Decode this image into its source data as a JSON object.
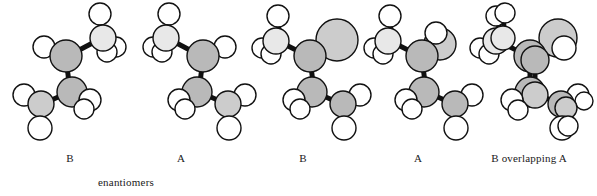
{
  "figure": {
    "type": "molecular-model-figure",
    "background": "#ffffff",
    "width": 597,
    "height": 196,
    "colors": {
      "hydrogen": "#ffffff",
      "carbon": "#b9b9b9",
      "carbon_light": "#e8e8e8",
      "substituent_large": "#cccccc",
      "outline": "#111111",
      "bond": "#111111",
      "text": "#1a1a1a"
    }
  },
  "models": [
    {
      "id": "model-1",
      "label": "B",
      "label_x": 70,
      "label_y": 152,
      "x": 8,
      "width": 132,
      "description": "ball-and-stick model B, first enantiomer"
    },
    {
      "id": "model-2",
      "label": "A",
      "label_x": 181,
      "label_y": 152,
      "x": 130,
      "width": 132,
      "description": "ball-and-stick model A, second enantiomer"
    },
    {
      "id": "model-3",
      "label": "B",
      "label_x": 303,
      "label_y": 152,
      "x": 252,
      "width": 132,
      "description": "ball-and-stick model B with large substituent sphere"
    },
    {
      "id": "model-4",
      "label": "A",
      "label_x": 418,
      "label_y": 152,
      "x": 364,
      "width": 132,
      "description": "ball-and-stick model A with large substituent sphere"
    },
    {
      "id": "model-5",
      "label": "B overlapping A",
      "label_x": 529,
      "label_y": 152,
      "x": 472,
      "width": 125,
      "description": "ball-and-stick model showing B superimposed on A"
    }
  ],
  "annotations": [
    {
      "id": "enantiomers-note",
      "text": "enantiomers",
      "x": 126,
      "y": 176
    }
  ]
}
